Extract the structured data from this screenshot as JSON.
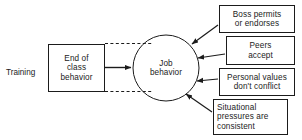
{
  "diagram": {
    "source_label": {
      "id": "training",
      "text": "Training",
      "x": 6,
      "y": 68,
      "width": 44,
      "height": 12
    },
    "boxes": [
      {
        "id": "end-of-class-behavior",
        "text": "End of\nclass\nbehavior",
        "x": 48,
        "y": 44,
        "width": 57,
        "height": 48,
        "align": "center"
      },
      {
        "id": "boss-permits-or-endorses",
        "text": "Boss permits\nor endorses",
        "x": 219,
        "y": 5,
        "width": 76,
        "height": 28,
        "align": "center"
      },
      {
        "id": "peers-accept",
        "text": "Peers\naccept",
        "x": 226,
        "y": 36,
        "width": 69,
        "height": 29,
        "align": "center"
      },
      {
        "id": "personal-values-dont-conflict",
        "text": "Personal values\ndon't conflict",
        "x": 219,
        "y": 68,
        "width": 76,
        "height": 28,
        "align": "center"
      },
      {
        "id": "situational-pressures-are-consistent",
        "text": "Situational\npressures are\nconsistent",
        "x": 213,
        "y": 99,
        "width": 75,
        "height": 36,
        "align": "left"
      }
    ],
    "circle": {
      "id": "job-behavior",
      "text": "Job\nbehavior",
      "cx": 166,
      "cy": 68,
      "r": 33
    },
    "connectors": [
      {
        "id": "class-behavior-to-job-behavior",
        "style": "solid-arrow",
        "from": "end-of-class-behavior",
        "to": "job-behavior"
      },
      {
        "id": "training-envelope-top",
        "style": "dashed",
        "from": "end-of-class-behavior",
        "to": "job-behavior"
      },
      {
        "id": "training-envelope-bottom",
        "style": "dashed",
        "from": "end-of-class-behavior",
        "to": "job-behavior"
      },
      {
        "id": "boss-to-job-behavior",
        "style": "solid-arrow",
        "from": "boss-permits-or-endorses",
        "to": "job-behavior"
      },
      {
        "id": "peers-to-job-behavior",
        "style": "solid-arrow",
        "from": "peers-accept",
        "to": "job-behavior"
      },
      {
        "id": "values-to-job-behavior",
        "style": "solid-arrow",
        "from": "personal-values-dont-conflict",
        "to": "job-behavior"
      },
      {
        "id": "pressures-to-job-behavior",
        "style": "solid-arrow",
        "from": "situational-pressures-are-consistent",
        "to": "job-behavior"
      }
    ],
    "colors": {
      "stroke": "#1b1b1b",
      "text": "#1b1b1b",
      "background": "#ffffff"
    }
  }
}
